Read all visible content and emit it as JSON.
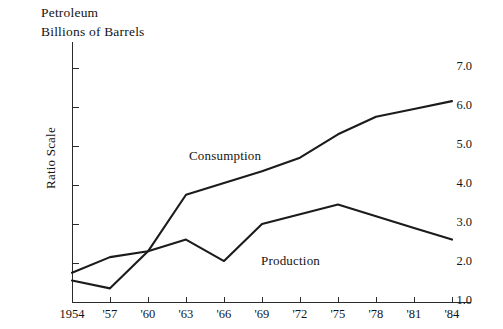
{
  "titles": {
    "line1": "Petroleum",
    "line2": "Billions of Barrels"
  },
  "axes": {
    "y_axis_title": "Ratio Scale",
    "y_ticks": [
      "7.0",
      "6.0",
      "5.0",
      "4.0",
      "3.0",
      "2.0",
      "1.0"
    ],
    "x_ticks": [
      "1954",
      "'57",
      "'60",
      "'63",
      "'66",
      "'69",
      "'72",
      "'75",
      "'78",
      "'81",
      "'84"
    ]
  },
  "labels": {
    "consumption": "Consumption",
    "production": "Production"
  },
  "colors": {
    "line": "#1b1b1b",
    "axis": "#2b2b2b",
    "text": "#141414",
    "background": "#ffffff"
  },
  "chart_data": {
    "type": "line",
    "title": "Petroleum Billions of Barrels",
    "xlabel": "",
    "ylabel": "Ratio Scale",
    "ylim": [
      1.0,
      7.0
    ],
    "ytick_values": [
      1.0,
      2.0,
      3.0,
      4.0,
      5.0,
      6.0,
      7.0
    ],
    "grid": false,
    "legend": "inline-annotations",
    "x": [
      1954,
      1957,
      1960,
      1963,
      1966,
      1969,
      1972,
      1975,
      1978,
      1981,
      1984
    ],
    "categories": [
      "1954",
      "'57",
      "'60",
      "'63",
      "'66",
      "'69",
      "'72",
      "'75",
      "'78",
      "'81",
      "'84"
    ],
    "series": [
      {
        "name": "Consumption",
        "values": [
          1.75,
          2.15,
          2.3,
          3.75,
          4.05,
          4.35,
          4.7,
          5.3,
          5.75,
          5.95,
          6.15
        ]
      },
      {
        "name": "Production",
        "values": [
          1.55,
          1.35,
          2.3,
          2.6,
          2.05,
          3.0,
          3.25,
          3.5,
          3.2,
          2.9,
          2.6
        ]
      }
    ],
    "annotations": [
      {
        "text": "Consumption",
        "series": "Consumption"
      },
      {
        "text": "Production",
        "series": "Production"
      }
    ]
  }
}
